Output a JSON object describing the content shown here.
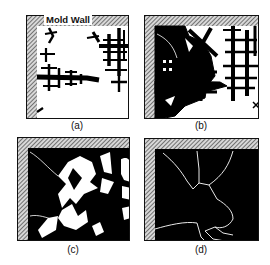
{
  "figure": {
    "wall_label": "Mold Wall",
    "panels": [
      {
        "id": "a",
        "caption": "(a)"
      },
      {
        "id": "b",
        "caption": "(b)"
      },
      {
        "id": "c",
        "caption": "(c)"
      },
      {
        "id": "d",
        "caption": "(d)"
      }
    ],
    "colors": {
      "solid": "#000000",
      "liquid": "#ffffff",
      "hatch": "#555555",
      "frame": "#111111"
    }
  }
}
